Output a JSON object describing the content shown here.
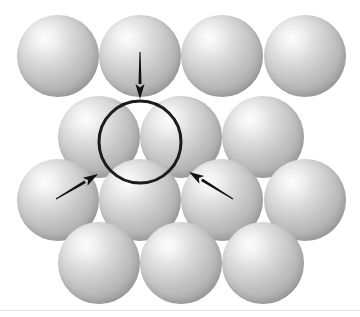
{
  "figure": {
    "width": 360,
    "height": 317,
    "background_color": "#ffffff",
    "caption": ""
  },
  "sphere_style": {
    "radius": 41,
    "highlight_color": "#fdfdfd",
    "midtone_color": "#c0c0c0",
    "shadow_color": "#8a8a8a",
    "rim_color": "#a2a2a2",
    "highlight_position_x": "34%",
    "highlight_position_y": "28%"
  },
  "rows": [
    {
      "name": "row-1",
      "label": "top layer row",
      "center_y": 56,
      "centers_x": [
        58,
        140,
        222,
        305
      ]
    },
    {
      "name": "row-2",
      "label": "offset row upper",
      "center_y": 137,
      "centers_x": [
        99,
        181,
        263
      ]
    },
    {
      "name": "row-3",
      "label": "offset row lower",
      "center_y": 200,
      "centers_x": [
        58,
        140,
        222,
        305
      ]
    },
    {
      "name": "row-4",
      "label": "bottom layer row",
      "center_y": 263,
      "centers_x": [
        99,
        181,
        263
      ]
    }
  ],
  "circle_marker": {
    "label": "interstitial site outline",
    "center_x": 140,
    "center_y": 142,
    "radius": 41,
    "stroke_color": "#1c1c1c",
    "stroke_width": 3
  },
  "arrows": [
    {
      "name": "arrow-top",
      "label": "arrow pointing down at void",
      "tail_x": 140,
      "tail_y": 52,
      "tip_x": 140,
      "tip_y": 99,
      "color": "#111111"
    },
    {
      "name": "arrow-left",
      "label": "arrow pointing up-right at void",
      "tail_x": 56,
      "tail_y": 199,
      "tip_x": 98,
      "tip_y": 174,
      "color": "#111111"
    },
    {
      "name": "arrow-right",
      "label": "arrow pointing up-left at void",
      "tail_x": 233,
      "tail_y": 199,
      "tip_x": 189,
      "tip_y": 172,
      "color": "#111111"
    }
  ],
  "baseline": {
    "y": 310,
    "color": "#e6e6e6"
  },
  "chart_data": {
    "type": "scatter",
    "xlabel": "",
    "ylabel": "",
    "xlim": [
      0,
      360
    ],
    "ylim": [
      0,
      317
    ],
    "grid": false,
    "legend": "none",
    "series": [
      {
        "name": "spheres",
        "marker": "circle",
        "marker_radius": 41,
        "points": [
          {
            "x": 58,
            "y": 56,
            "row": 1
          },
          {
            "x": 140,
            "y": 56,
            "row": 1
          },
          {
            "x": 222,
            "y": 56,
            "row": 1
          },
          {
            "x": 305,
            "y": 56,
            "row": 1
          },
          {
            "x": 99,
            "y": 137,
            "row": 2
          },
          {
            "x": 181,
            "y": 137,
            "row": 2
          },
          {
            "x": 263,
            "y": 137,
            "row": 2
          },
          {
            "x": 58,
            "y": 200,
            "row": 3
          },
          {
            "x": 140,
            "y": 200,
            "row": 3
          },
          {
            "x": 222,
            "y": 200,
            "row": 3
          },
          {
            "x": 305,
            "y": 200,
            "row": 3
          },
          {
            "x": 99,
            "y": 263,
            "row": 4
          },
          {
            "x": 181,
            "y": 263,
            "row": 4
          },
          {
            "x": 263,
            "y": 263,
            "row": 4
          }
        ]
      },
      {
        "name": "interstitial-outline",
        "marker": "circle-outline",
        "points": [
          {
            "x": 140,
            "y": 142,
            "r": 41
          }
        ]
      },
      {
        "name": "annotation-arrows",
        "marker": "arrow",
        "points": [
          {
            "x1": 140,
            "y1": 52,
            "x2": 140,
            "y2": 99
          },
          {
            "x1": 56,
            "y1": 199,
            "x2": 98,
            "y2": 174
          },
          {
            "x1": 233,
            "y1": 199,
            "x2": 189,
            "y2": 172
          }
        ]
      }
    ],
    "annotations": []
  }
}
